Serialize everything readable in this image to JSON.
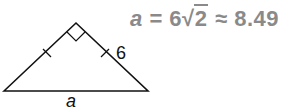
{
  "diagram": {
    "type": "isosceles right triangle",
    "vertices": {
      "left": [
        4,
        91
      ],
      "apex": [
        76,
        23
      ],
      "right": [
        148,
        91
      ]
    },
    "right_angle_at": "apex",
    "congruent_leg_ticks": true,
    "labels": {
      "leg": "6",
      "hypotenuse": "a"
    }
  },
  "equation": {
    "variable": "a",
    "equals": "=",
    "coefficient": "6",
    "radical_symbol": "√",
    "radicand": "2",
    "approx": "≈",
    "value": "8.49",
    "color": "#8a8a8a"
  }
}
